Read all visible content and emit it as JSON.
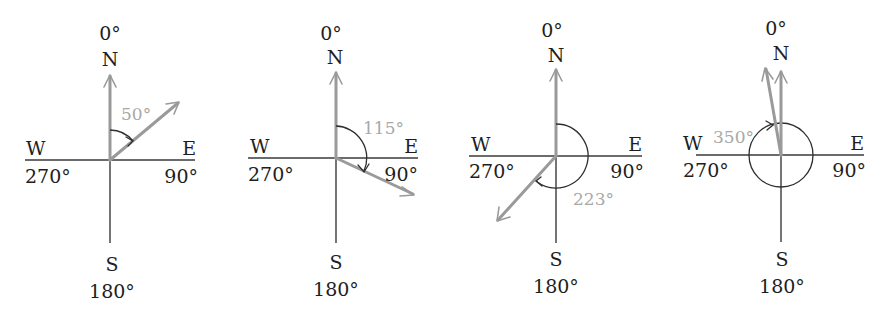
{
  "diagrams": [
    {
      "id": "bearing-50",
      "labels": {
        "north_deg": "0°",
        "north": "N",
        "west": "W",
        "west_deg": "270°",
        "east": "E",
        "east_deg": "90°",
        "south": "S",
        "south_deg": "180°"
      },
      "bearing": 50,
      "angle_label": "50°"
    },
    {
      "id": "bearing-115",
      "labels": {
        "north_deg": "0°",
        "north": "N",
        "west": "W",
        "west_deg": "270°",
        "east": "E",
        "east_deg": "90°",
        "south": "S",
        "south_deg": "180°"
      },
      "bearing": 115,
      "angle_label": "115°"
    },
    {
      "id": "bearing-223",
      "labels": {
        "north_deg": "0°",
        "north": "N",
        "west": "W",
        "west_deg": "270°",
        "east": "E",
        "east_deg": "90°",
        "south": "S",
        "south_deg": "180°"
      },
      "bearing": 223,
      "angle_label": "223°"
    },
    {
      "id": "bearing-350",
      "labels": {
        "north_deg": "0°",
        "north": "N",
        "west": "W",
        "west_deg": "270°",
        "east": "E",
        "east_deg": "90°",
        "south": "S",
        "south_deg": "180°"
      },
      "bearing": 350,
      "angle_label": "350°"
    }
  ],
  "colors": {
    "axis": "#3a3a3a",
    "vector": "#9a9a9a",
    "angle_label": "#a8a8a8",
    "text": "#1e1e1e"
  }
}
